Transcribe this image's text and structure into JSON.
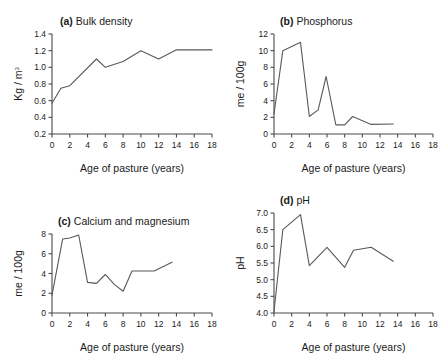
{
  "figure": {
    "background": "#ffffff",
    "line_color": "#555a5e",
    "axis_color": "#4a4a4a",
    "shared_xlabel": "Age of pasture (years)"
  },
  "chart_data": [
    {
      "panel": "a",
      "type": "line",
      "title": "(a) Bulk density",
      "title_tag": "(a)",
      "title_text": "Bulk density",
      "xlabel": "Age of pasture (years)",
      "ylabel": "Kg / m",
      "ylabel_sup": "3",
      "xlim": [
        0,
        18
      ],
      "ylim": [
        0.2,
        1.4
      ],
      "xticks": [
        0,
        2,
        4,
        6,
        8,
        10,
        12,
        14,
        16,
        18
      ],
      "yticks": [
        0.2,
        0.4,
        0.6,
        0.8,
        1.0,
        1.2,
        1.4
      ],
      "ytick_labels": [
        "0.2",
        "0.4",
        "0.6",
        "0.8",
        "1.0",
        "1.2",
        "1.4"
      ],
      "grid": false,
      "legend": "none",
      "x": [
        0,
        1,
        2,
        5,
        6,
        8,
        10,
        12,
        14,
        18
      ],
      "values": [
        0.57,
        0.75,
        0.78,
        1.1,
        1.0,
        1.07,
        1.2,
        1.1,
        1.21,
        1.21
      ]
    },
    {
      "panel": "b",
      "type": "line",
      "title": "(b) Phosphorus",
      "title_tag": "(b)",
      "title_text": "Phosphorus",
      "xlabel": "Age of pasture (years)",
      "ylabel": "me / 100g",
      "xlim": [
        0,
        18
      ],
      "ylim": [
        0,
        12
      ],
      "xticks": [
        0,
        2,
        4,
        6,
        8,
        10,
        12,
        14,
        16,
        18
      ],
      "yticks": [
        0,
        2,
        4,
        6,
        8,
        10,
        12
      ],
      "ytick_labels": [
        "0",
        "2",
        "4",
        "6",
        "8",
        "10",
        "12"
      ],
      "grid": false,
      "legend": "none",
      "x": [
        0,
        1,
        3,
        4,
        5,
        5.9,
        7,
        8,
        8.9,
        11,
        13.5
      ],
      "values": [
        2.4,
        10.0,
        11.0,
        2.1,
        2.9,
        6.9,
        1.1,
        1.1,
        2.1,
        1.15,
        1.2
      ]
    },
    {
      "panel": "c",
      "type": "line",
      "title": "(c) Calcium and magnesium",
      "title_tag": "(c)",
      "title_text": "Calcium and magnesium",
      "xlabel": "Age of pasture (years)",
      "ylabel": "me / 100g",
      "xlim": [
        0,
        18
      ],
      "ylim": [
        0,
        8
      ],
      "xticks": [
        0,
        2,
        4,
        6,
        8,
        10,
        12,
        14,
        16,
        18
      ],
      "yticks": [
        0,
        2,
        4,
        6,
        8
      ],
      "ytick_labels": [
        "0",
        "2",
        "4",
        "6",
        "8"
      ],
      "grid": false,
      "legend": "none",
      "x": [
        0,
        1.2,
        2,
        3,
        4,
        5,
        6,
        7,
        8,
        9,
        11.5,
        13.5
      ],
      "values": [
        1.8,
        7.5,
        7.6,
        7.9,
        3.1,
        3.0,
        3.9,
        2.9,
        2.2,
        4.25,
        4.25,
        5.15
      ]
    },
    {
      "panel": "d",
      "type": "line",
      "title": "(d) pH",
      "title_tag": "(d)",
      "title_text": "pH",
      "xlabel": "Age of pasture (years)",
      "ylabel": "pH",
      "xlim": [
        0,
        18
      ],
      "ylim": [
        4.0,
        7.0
      ],
      "xticks": [
        0,
        2,
        4,
        6,
        8,
        10,
        12,
        14,
        16,
        18
      ],
      "yticks": [
        4.0,
        4.5,
        5.0,
        5.5,
        6.0,
        6.5,
        7.0
      ],
      "ytick_labels": [
        "4.0",
        "4.5",
        "5.0",
        "5.5",
        "6.0",
        "6.5",
        "7.0"
      ],
      "grid": false,
      "legend": "none",
      "x": [
        0,
        1,
        3,
        4,
        6,
        8,
        9,
        11,
        13.5
      ],
      "values": [
        4.05,
        6.5,
        6.95,
        5.42,
        5.97,
        5.37,
        5.88,
        5.97,
        5.55
      ]
    }
  ]
}
